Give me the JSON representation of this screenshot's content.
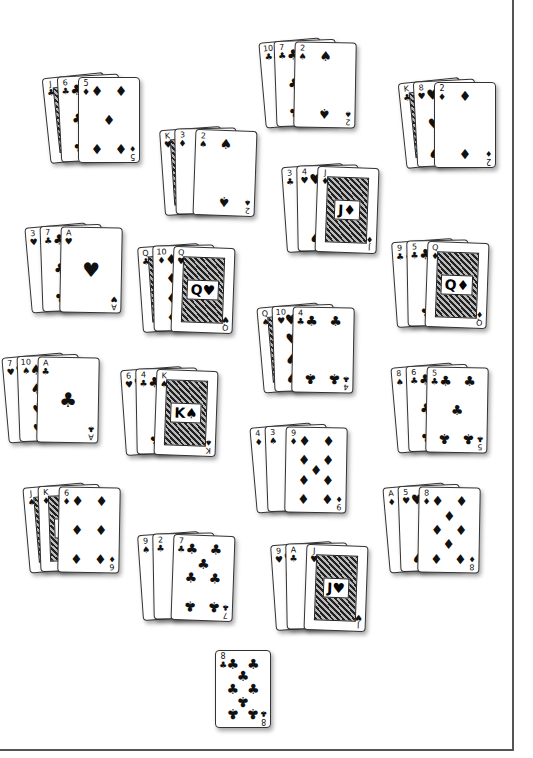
{
  "game": {
    "type": "card-layout",
    "table_color": "#ffffff",
    "border_color": "#555555",
    "suit_symbols": {
      "clubs": "♣",
      "spades": "♠",
      "hearts": "♥",
      "diamonds": "♦"
    }
  },
  "hands": [
    {
      "id": "hand-1",
      "x": 46,
      "y": 75,
      "rot": -6,
      "cards": [
        {
          "rank": "J",
          "suit": "♣"
        },
        {
          "rank": "6",
          "suit": "♣"
        },
        {
          "rank": "5",
          "suit": "♦"
        }
      ]
    },
    {
      "id": "hand-2",
      "x": 262,
      "y": 40,
      "rot": -5,
      "cards": [
        {
          "rank": "10",
          "suit": "♣"
        },
        {
          "rank": "7",
          "suit": "♣"
        },
        {
          "rank": "2",
          "suit": "♠"
        }
      ]
    },
    {
      "id": "hand-3",
      "x": 402,
      "y": 80,
      "rot": -6,
      "cards": [
        {
          "rank": "K",
          "suit": "♣"
        },
        {
          "rank": "8",
          "suit": "♥"
        },
        {
          "rank": "2",
          "suit": "♦"
        }
      ]
    },
    {
      "id": "hand-4",
      "x": 162,
      "y": 128,
      "rot": -4,
      "cards": [
        {
          "rank": "K",
          "suit": "♥"
        },
        {
          "rank": "3",
          "suit": "♦"
        },
        {
          "rank": "2",
          "suit": "♠"
        }
      ]
    },
    {
      "id": "hand-5",
      "x": 284,
      "y": 165,
      "rot": -4,
      "cards": [
        {
          "rank": "3",
          "suit": "♣"
        },
        {
          "rank": "4",
          "suit": "♥"
        },
        {
          "rank": "J",
          "suit": "♦"
        }
      ]
    },
    {
      "id": "hand-6",
      "x": 28,
      "y": 225,
      "rot": -5,
      "cards": [
        {
          "rank": "3",
          "suit": "♥"
        },
        {
          "rank": "7",
          "suit": "♣"
        },
        {
          "rank": "A",
          "suit": "♥"
        }
      ]
    },
    {
      "id": "hand-7",
      "x": 140,
      "y": 245,
      "rot": -4,
      "cards": [
        {
          "rank": "Q",
          "suit": "♣"
        },
        {
          "rank": "10",
          "suit": "♦"
        },
        {
          "rank": "Q",
          "suit": "♥"
        }
      ]
    },
    {
      "id": "hand-8",
      "x": 394,
      "y": 240,
      "rot": -4,
      "cards": [
        {
          "rank": "9",
          "suit": "♣"
        },
        {
          "rank": "5",
          "suit": "♣"
        },
        {
          "rank": "Q",
          "suit": "♦"
        }
      ]
    },
    {
      "id": "hand-9",
      "x": 260,
      "y": 305,
      "rot": -5,
      "cards": [
        {
          "rank": "Q",
          "suit": "♠"
        },
        {
          "rank": "10",
          "suit": "♥"
        },
        {
          "rank": "4",
          "suit": "♣"
        }
      ]
    },
    {
      "id": "hand-10",
      "x": 5,
      "y": 355,
      "rot": -5,
      "cards": [
        {
          "rank": "7",
          "suit": "♥"
        },
        {
          "rank": "10",
          "suit": "♠"
        },
        {
          "rank": "A",
          "suit": "♣"
        }
      ]
    },
    {
      "id": "hand-11",
      "x": 123,
      "y": 368,
      "rot": -4,
      "cards": [
        {
          "rank": "6",
          "suit": "♥"
        },
        {
          "rank": "4",
          "suit": "♣"
        },
        {
          "rank": "K",
          "suit": "♠"
        }
      ]
    },
    {
      "id": "hand-12",
      "x": 394,
      "y": 365,
      "rot": -5,
      "cards": [
        {
          "rank": "8",
          "suit": "♠"
        },
        {
          "rank": "6",
          "suit": "♣"
        },
        {
          "rank": "5",
          "suit": "♣"
        }
      ]
    },
    {
      "id": "hand-13",
      "x": 253,
      "y": 425,
      "rot": -5,
      "cards": [
        {
          "rank": "4",
          "suit": "♦"
        },
        {
          "rank": "3",
          "suit": "♠"
        },
        {
          "rank": "9",
          "suit": "♦"
        }
      ]
    },
    {
      "id": "hand-14",
      "x": 26,
      "y": 485,
      "rot": -5,
      "cards": [
        {
          "rank": "J",
          "suit": "♠"
        },
        {
          "rank": "K",
          "suit": "♦"
        },
        {
          "rank": "6",
          "suit": "♦"
        }
      ]
    },
    {
      "id": "hand-15",
      "x": 386,
      "y": 485,
      "rot": -5,
      "cards": [
        {
          "rank": "A",
          "suit": "♦"
        },
        {
          "rank": "5",
          "suit": "♥"
        },
        {
          "rank": "8",
          "suit": "♦"
        }
      ]
    },
    {
      "id": "hand-16",
      "x": 140,
      "y": 533,
      "rot": -4,
      "cards": [
        {
          "rank": "9",
          "suit": "♠"
        },
        {
          "rank": "2",
          "suit": "♣"
        },
        {
          "rank": "7",
          "suit": "♣"
        }
      ]
    },
    {
      "id": "hand-17",
      "x": 273,
      "y": 543,
      "rot": -4,
      "cards": [
        {
          "rank": "9",
          "suit": "♥"
        },
        {
          "rank": "A",
          "suit": "♣"
        },
        {
          "rank": "J",
          "suit": "♥"
        }
      ]
    }
  ],
  "single_card": {
    "id": "single-card",
    "x": 215,
    "y": 650,
    "rank": "8",
    "suit": "♣"
  }
}
